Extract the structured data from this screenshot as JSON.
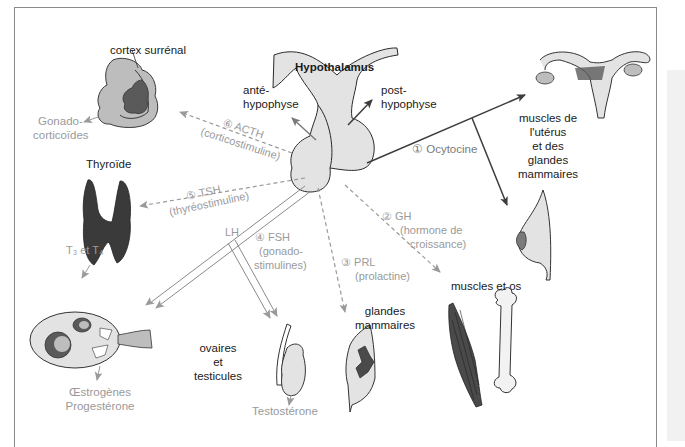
{
  "diagram": {
    "center": {
      "hypothalamus": "Hypothalamus",
      "ante_hypophyse": [
        "anté-",
        "hypophyse"
      ],
      "post_hypophyse": [
        "post-",
        "hypophyse"
      ]
    },
    "hormones": [
      {
        "num": "①",
        "name": "Ocytocine",
        "detail": "",
        "style": "solid-dark"
      },
      {
        "num": "②",
        "name": "GH",
        "detail": [
          "(hormone de",
          "croissance)"
        ],
        "style": "dashed-grey"
      },
      {
        "num": "③",
        "name": "PRL",
        "detail": "(prolactine)",
        "style": "dashed-grey"
      },
      {
        "num": "④",
        "name": "FSH",
        "detail": [
          "(gonado-",
          "stimulines)"
        ],
        "style": "double-grey"
      },
      {
        "num": "⑤",
        "name": "TSH",
        "detail": "(thyréostimuline)",
        "style": "dashed-grey"
      },
      {
        "num": "⑥",
        "name": "ACTH",
        "detail": "(corticostimuline)",
        "style": "dashed-grey"
      }
    ],
    "lh_label": "LH",
    "targets": {
      "cortex": {
        "label": "cortex surrénal",
        "secretion": [
          "Gonado-",
          "corticoïdes"
        ]
      },
      "thyroid": {
        "label": "Thyroïde",
        "secretion": "T₃ et T₄"
      },
      "uterus": {
        "label": [
          "muscles de",
          "l'utérus",
          "et des",
          "glandes",
          "mammaires"
        ]
      },
      "gonads": {
        "label": [
          "ovaires",
          "et",
          "testicules"
        ],
        "ovary_secretion": [
          "Œstrogènes",
          "Progestérone"
        ],
        "testis_secretion": "Testostérone"
      },
      "mammary": {
        "label": [
          "glandes",
          "mammaires"
        ]
      },
      "muscle_bone": {
        "label": "muscles et os"
      }
    },
    "colors": {
      "dark_line": "#3c3c3c",
      "grey_line": "#9a9a9a",
      "organ_fill": "#e3e3e3",
      "organ_dark": "#4a4a4a",
      "text_grey": "#9a9a9a"
    }
  }
}
